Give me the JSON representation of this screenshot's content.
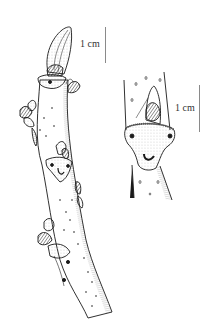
{
  "figure": {
    "colors": {
      "ink": "#1a1a1a",
      "scale_bar": "#8a8a8a",
      "background": "#ffffff"
    }
  },
  "twig": {
    "scale_label": "1 cm"
  },
  "detail": {
    "scale_label": "1 cm"
  }
}
